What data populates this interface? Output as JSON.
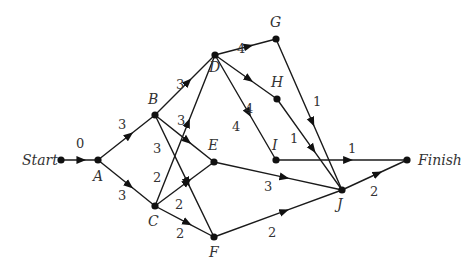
{
  "diagram": {
    "type": "activity-network",
    "nodes": [
      {
        "id": "Start",
        "label": "Start",
        "x": 61,
        "y": 160,
        "lx": 22,
        "ly": 165
      },
      {
        "id": "A",
        "label": "A",
        "x": 98,
        "y": 160,
        "lx": 93,
        "ly": 181
      },
      {
        "id": "B",
        "label": "B",
        "x": 155,
        "y": 115,
        "lx": 148,
        "ly": 104
      },
      {
        "id": "C",
        "label": "C",
        "x": 155,
        "y": 206,
        "lx": 148,
        "ly": 226
      },
      {
        "id": "D",
        "label": "D",
        "x": 215,
        "y": 55,
        "lx": 209,
        "ly": 72
      },
      {
        "id": "E",
        "label": "E",
        "x": 214,
        "y": 162,
        "lx": 208,
        "ly": 150
      },
      {
        "id": "F",
        "label": "F",
        "x": 214,
        "y": 237,
        "lx": 209,
        "ly": 257
      },
      {
        "id": "G",
        "label": "G",
        "x": 276,
        "y": 39,
        "lx": 270,
        "ly": 27
      },
      {
        "id": "H",
        "label": "H",
        "x": 277,
        "y": 99,
        "lx": 271,
        "ly": 87
      },
      {
        "id": "I",
        "label": "I",
        "x": 276,
        "y": 160,
        "lx": 272,
        "ly": 150
      },
      {
        "id": "J",
        "label": "J",
        "x": 342,
        "y": 190,
        "lx": 337,
        "ly": 209
      },
      {
        "id": "Finish",
        "label": "Finish",
        "x": 407,
        "y": 160,
        "lx": 418,
        "ly": 165
      }
    ],
    "edges": [
      {
        "from": "Start",
        "to": "A",
        "weight": "0",
        "wx": 76,
        "wy": 148
      },
      {
        "from": "A",
        "to": "B",
        "weight": "3",
        "wx": 118,
        "wy": 129
      },
      {
        "from": "A",
        "to": "C",
        "weight": "3",
        "wx": 118,
        "wy": 200
      },
      {
        "from": "B",
        "to": "D",
        "weight": "3",
        "wx": 176,
        "wy": 89
      },
      {
        "from": "B",
        "to": "E",
        "weight": "3",
        "wx": 177,
        "wy": 125
      },
      {
        "from": "B",
        "to": "F",
        "weight": "3",
        "wx": 153,
        "wy": 153
      },
      {
        "from": "C",
        "to": "D",
        "weight": "2",
        "wx": 153,
        "wy": 182
      },
      {
        "from": "C",
        "to": "E",
        "weight": "2",
        "wx": 175,
        "wy": 209
      },
      {
        "from": "C",
        "to": "F",
        "weight": "2",
        "wx": 176,
        "wy": 238
      },
      {
        "from": "D",
        "to": "G",
        "weight": "4",
        "wx": 237,
        "wy": 53
      },
      {
        "from": "D",
        "to": "H",
        "weight": "4",
        "wx": 245,
        "wy": 113
      },
      {
        "from": "D",
        "to": "I",
        "weight": "4",
        "wx": 232,
        "wy": 131
      },
      {
        "from": "E",
        "to": "J",
        "weight": "3",
        "wx": 264,
        "wy": 191
      },
      {
        "from": "F",
        "to": "J",
        "weight": "2",
        "wx": 268,
        "wy": 237
      },
      {
        "from": "G",
        "to": "J",
        "weight": "1",
        "wx": 313,
        "wy": 106
      },
      {
        "from": "H",
        "to": "J",
        "weight": "1",
        "wx": 290,
        "wy": 143
      },
      {
        "from": "I",
        "to": "Finish",
        "weight": "1",
        "wx": 348,
        "wy": 153
      },
      {
        "from": "J",
        "to": "Finish",
        "weight": "2",
        "wx": 370,
        "wy": 196
      }
    ]
  }
}
